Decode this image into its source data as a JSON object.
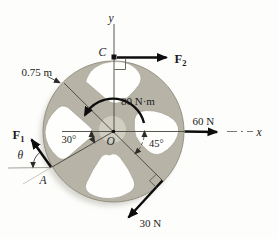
{
  "figure": {
    "type": "statics-wheel-free-body-diagram",
    "colors": {
      "background": "#fdfdfb",
      "wheel": "#b7b3a6",
      "hub": "#d3d0c3",
      "cutout": "#fefefc",
      "ink": "#1c1c1c",
      "thin_line": "#44433c"
    },
    "labels": {
      "axis_y": "y",
      "axis_x": "x",
      "point_c": "C",
      "point_o": "O",
      "point_a": "A",
      "theta": "θ",
      "angle_left": "30°",
      "angle_right": "45°",
      "moment": "80 N·m",
      "radius": "0.75 m",
      "force_right": "60 N",
      "force_bottom": "30 N",
      "f1_main": "F",
      "f1_sub": "1",
      "f2_main": "F",
      "f2_sub": "2"
    }
  }
}
